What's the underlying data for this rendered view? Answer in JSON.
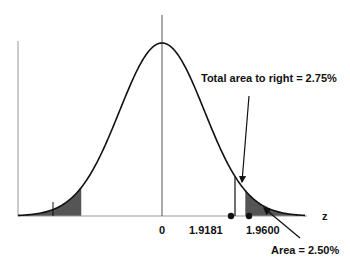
{
  "chart_data": {
    "type": "area",
    "title": "",
    "xlabel": "z",
    "ylabel": "",
    "x_ticks": [
      {
        "label": "0",
        "value": 0
      },
      {
        "label": "1.9181",
        "value": 1.9181
      },
      {
        "label": "1.9600",
        "value": 1.96
      }
    ],
    "shaded_regions": [
      {
        "side": "left",
        "from": "-inf",
        "to": -1.96
      },
      {
        "side": "right",
        "from": 1.96,
        "to": "inf",
        "area_pct": 2.5
      }
    ],
    "markers": [
      {
        "z": 1.9181,
        "type": "point"
      },
      {
        "z": 1.96,
        "type": "point"
      }
    ],
    "annotations": [
      {
        "text": "Total area to right = 2.75%",
        "points_to_z": 1.9181
      },
      {
        "text": "Area = 2.50%",
        "points_to_z": 2.1
      }
    ],
    "grid": false,
    "legend": "none",
    "colors": {
      "curve": "#111111",
      "shade": "#555555",
      "axis": "#888888"
    }
  },
  "labels": {
    "axis_z": "z",
    "tick_0": "0",
    "tick_19181": "1.9181",
    "tick_19600": "1.9600",
    "annotation_total": "Total area to right = 2.75%",
    "annotation_area": "Area = 2.50%"
  }
}
